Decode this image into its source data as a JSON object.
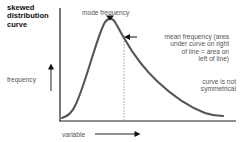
{
  "diagram": {
    "title": "skewed\ndistribution\ncurve",
    "labels": {
      "mode": "mode frequency",
      "mean": "mean frequency (area\nunder curve on right\nof line = area on\nleft of line)",
      "y_axis": "frequency",
      "x_axis": "variable",
      "note": "curve is not\nsymmetrical"
    },
    "colors": {
      "axis": "#222222",
      "curve": "#555555",
      "dashed_line": "#999999",
      "text": "#555555",
      "title": "#111111"
    },
    "curve": {
      "shape": "positively skewed distribution",
      "peak_position": "left of center",
      "mean_line": "dashed vertical line to the right of the mode"
    }
  }
}
